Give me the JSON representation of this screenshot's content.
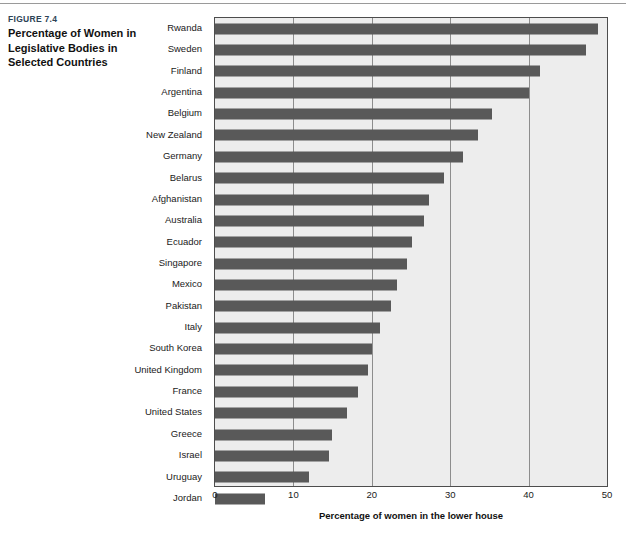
{
  "caption": {
    "figure_number": "FIGURE 7.4",
    "title": "Percentage of Women in Legislative Bodies in Selected Countries"
  },
  "colors": {
    "bar": "#595959",
    "plot_background": "#ededed",
    "gridline": "#8d8d8d",
    "axis_border": "#4d4d4d",
    "figure_number_text": "#2d4356"
  },
  "chart_data": {
    "type": "bar",
    "orientation": "horizontal",
    "title": "Percentage of Women in Legislative Bodies in Selected Countries",
    "xlabel": "Percentage of women in the lower house",
    "ylabel": "",
    "xlim": [
      0,
      50
    ],
    "xticks": [
      0,
      10,
      20,
      30,
      40,
      50
    ],
    "xtick_labels": [
      "0",
      "10",
      "20",
      "30",
      "40",
      "50"
    ],
    "grid": "vertical",
    "legend": "none",
    "categories": [
      "Rwanda",
      "Sweden",
      "Finland",
      "Argentina",
      "Belgium",
      "New Zealand",
      "Germany",
      "Belarus",
      "Afghanistan",
      "Australia",
      "Ecuador",
      "Singapore",
      "Mexico",
      "Pakistan",
      "Italy",
      "South Korea",
      "United Kingdom",
      "France",
      "United States",
      "Greece",
      "Israel",
      "Uruguay",
      "Jordan"
    ],
    "values": [
      48.8,
      47.3,
      41.5,
      40.0,
      35.3,
      33.6,
      31.6,
      29.2,
      27.3,
      26.7,
      25.1,
      24.5,
      23.2,
      22.5,
      21.1,
      20.0,
      19.5,
      18.2,
      16.9,
      14.9,
      14.5,
      12.0,
      6.4
    ]
  }
}
